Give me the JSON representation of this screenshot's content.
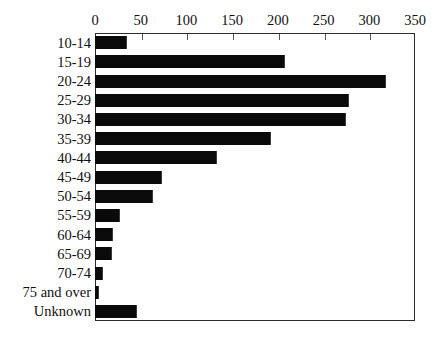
{
  "chart_data": {
    "type": "bar",
    "orientation": "horizontal",
    "title": "",
    "xlabel": "",
    "ylabel": "",
    "xlim": [
      0,
      350
    ],
    "xticks": [
      0,
      50,
      100,
      150,
      200,
      250,
      300,
      350
    ],
    "grid": false,
    "legend": null,
    "bar_color": "#0a0a0a",
    "frame_color": "#2b2b2b",
    "categories": [
      "10-14",
      "15-19",
      "20-24",
      "25-29",
      "30-34",
      "35-39",
      "40-44",
      "45-49",
      "50-54",
      "55-59",
      "60-64",
      "65-69",
      "70-74",
      "75 and over",
      "Unknown"
    ],
    "values": [
      35,
      208,
      318,
      278,
      275,
      193,
      133,
      73,
      63,
      27,
      20,
      19,
      9,
      4,
      46
    ]
  }
}
